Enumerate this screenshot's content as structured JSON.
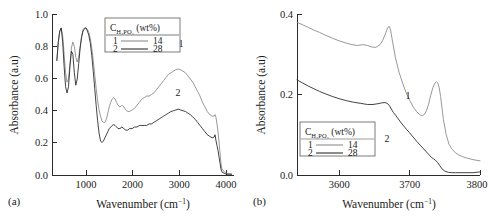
{
  "figure": {
    "panel_a_label": "(a)",
    "panel_b_label": "(b)"
  },
  "panel_a": {
    "xlabel_main": "Wavenumber (cm",
    "xlabel_sup": "−1",
    "xlabel_close": ")",
    "ylabel": "Absorbance (a.u)",
    "xticks": [
      "1000",
      "2000",
      "3000",
      "4000"
    ],
    "yticks": [
      "0.0",
      "0.2",
      "0.4",
      "0.6",
      "0.8",
      "1.0"
    ],
    "legend": {
      "title_c": "C",
      "title_sub": "H₃PO₄",
      "title_unit": " (wt%)",
      "row1_key": "1",
      "row1_value": "14",
      "row2_key": "2",
      "row2_value": "28"
    },
    "annotations": {
      "curve1": "1",
      "curve2": "2"
    }
  },
  "panel_b": {
    "xlabel_main": "Wavenumber (cm",
    "xlabel_sup": "−1",
    "xlabel_close": ")",
    "ylabel": "Absorbance (a.u)",
    "xticks": [
      "3600",
      "3700",
      "3800"
    ],
    "yticks": [
      "0.0",
      "0.2",
      "0.4"
    ],
    "legend": {
      "title_c": "C",
      "title_sub": "H₃PO₄",
      "title_unit": " (wt%)",
      "row1_key": "1",
      "row1_value": "14",
      "row2_key": "2",
      "row2_value": "28"
    },
    "annotations": {
      "curve1": "1",
      "curve2": "2"
    }
  },
  "chart_data": [
    {
      "type": "line",
      "panel": "a",
      "title": "",
      "xlabel": "Wavenumber (cm-1)",
      "ylabel": "Absorbance (a.u)",
      "xlim": [
        300,
        4050
      ],
      "ylim": [
        0.0,
        1.04
      ],
      "xticks": [
        1000,
        2000,
        3000,
        4000
      ],
      "yticks": [
        0.0,
        0.2,
        0.4,
        0.6,
        0.8,
        1.0
      ],
      "grid": false,
      "legend_position": "upper-center",
      "series": [
        {
          "name": "14",
          "label": "1",
          "color": "#8c8c8c",
          "x": [
            400,
            430,
            460,
            490,
            520,
            550,
            580,
            610,
            640,
            670,
            700,
            730,
            760,
            790,
            820,
            850,
            880,
            910,
            940,
            970,
            1000,
            1030,
            1060,
            1090,
            1120,
            1150,
            1180,
            1210,
            1240,
            1270,
            1300,
            1330,
            1360,
            1390,
            1420,
            1450,
            1480,
            1510,
            1540,
            1570,
            1600,
            1630,
            1660,
            1700,
            1740,
            1780,
            1820,
            1860,
            1900,
            1950,
            2000,
            2050,
            2100,
            2150,
            2200,
            2250,
            2300,
            2350,
            2400,
            2450,
            2500,
            2550,
            2600,
            2650,
            2700,
            2750,
            2800,
            2850,
            2900,
            2950,
            3000,
            3050,
            3100,
            3150,
            3200,
            3250,
            3300,
            3350,
            3400,
            3450,
            3500,
            3550,
            3600,
            3640,
            3660,
            3680,
            3700,
            3720,
            3740,
            3760,
            3780,
            3800,
            3850,
            3900,
            4000
          ],
          "y": [
            0.74,
            0.86,
            0.93,
            0.95,
            0.9,
            0.78,
            0.66,
            0.6,
            0.62,
            0.72,
            0.82,
            0.86,
            0.83,
            0.76,
            0.73,
            0.76,
            0.83,
            0.9,
            0.94,
            0.95,
            0.95,
            0.94,
            0.92,
            0.88,
            0.82,
            0.74,
            0.65,
            0.56,
            0.48,
            0.42,
            0.38,
            0.35,
            0.34,
            0.34,
            0.36,
            0.4,
            0.44,
            0.47,
            0.49,
            0.5,
            0.49,
            0.47,
            0.45,
            0.44,
            0.45,
            0.44,
            0.42,
            0.41,
            0.41,
            0.42,
            0.43,
            0.45,
            0.47,
            0.49,
            0.5,
            0.51,
            0.51,
            0.52,
            0.53,
            0.55,
            0.57,
            0.59,
            0.61,
            0.63,
            0.65,
            0.66,
            0.67,
            0.68,
            0.685,
            0.68,
            0.67,
            0.66,
            0.64,
            0.62,
            0.6,
            0.57,
            0.54,
            0.51,
            0.47,
            0.44,
            0.41,
            0.39,
            0.38,
            0.38,
            0.39,
            0.37,
            0.33,
            0.28,
            0.22,
            0.15,
            0.08,
            0.04,
            0.02,
            0.01,
            0.005,
            0.005
          ]
        },
        {
          "name": "28",
          "label": "2",
          "color": "#2e2e2e",
          "x": [
            400,
            430,
            460,
            490,
            520,
            550,
            580,
            610,
            640,
            670,
            700,
            730,
            760,
            790,
            820,
            850,
            880,
            910,
            940,
            970,
            1000,
            1030,
            1060,
            1090,
            1120,
            1150,
            1180,
            1210,
            1240,
            1270,
            1300,
            1330,
            1360,
            1390,
            1420,
            1450,
            1480,
            1510,
            1540,
            1570,
            1600,
            1630,
            1660,
            1700,
            1740,
            1780,
            1820,
            1860,
            1900,
            1950,
            2000,
            2050,
            2100,
            2150,
            2200,
            2250,
            2300,
            2350,
            2400,
            2450,
            2500,
            2550,
            2600,
            2650,
            2700,
            2750,
            2800,
            2850,
            2900,
            2950,
            3000,
            3050,
            3100,
            3150,
            3200,
            3250,
            3300,
            3350,
            3400,
            3450,
            3500,
            3550,
            3600,
            3640,
            3660,
            3680,
            3700,
            3720,
            3740,
            3760,
            3780,
            3800,
            3850,
            3900,
            4000
          ],
          "y": [
            0.74,
            0.86,
            0.93,
            0.95,
            0.86,
            0.7,
            0.57,
            0.53,
            0.57,
            0.7,
            0.8,
            0.78,
            0.66,
            0.58,
            0.62,
            0.72,
            0.82,
            0.89,
            0.93,
            0.945,
            0.95,
            0.93,
            0.9,
            0.85,
            0.77,
            0.67,
            0.56,
            0.45,
            0.35,
            0.27,
            0.22,
            0.21,
            0.22,
            0.24,
            0.26,
            0.28,
            0.3,
            0.31,
            0.32,
            0.325,
            0.32,
            0.31,
            0.3,
            0.3,
            0.31,
            0.3,
            0.29,
            0.29,
            0.3,
            0.3,
            0.31,
            0.31,
            0.32,
            0.32,
            0.32,
            0.32,
            0.33,
            0.33,
            0.34,
            0.35,
            0.36,
            0.37,
            0.38,
            0.39,
            0.4,
            0.41,
            0.415,
            0.42,
            0.425,
            0.42,
            0.415,
            0.41,
            0.4,
            0.39,
            0.375,
            0.36,
            0.34,
            0.32,
            0.3,
            0.28,
            0.26,
            0.25,
            0.24,
            0.245,
            0.26,
            0.22,
            0.19,
            0.16,
            0.12,
            0.08,
            0.04,
            0.02,
            0.01,
            0.005,
            0.005,
            0.005
          ]
        }
      ]
    },
    {
      "type": "line",
      "panel": "b",
      "title": "",
      "xlabel": "Wavenumber (cm-1)",
      "ylabel": "Absorbance (a.u)",
      "xlim": [
        3540,
        3800
      ],
      "ylim": [
        0.0,
        0.42
      ],
      "xticks": [
        3600,
        3700,
        3800
      ],
      "yticks": [
        0.0,
        0.2,
        0.4
      ],
      "grid": false,
      "legend_position": "lower-left",
      "series": [
        {
          "name": "14",
          "label": "1",
          "color": "#8c8c8c",
          "x": [
            3540,
            3548,
            3556,
            3564,
            3572,
            3580,
            3590,
            3600,
            3610,
            3618,
            3626,
            3634,
            3640,
            3646,
            3652,
            3658,
            3662,
            3666,
            3669,
            3671,
            3673,
            3676,
            3680,
            3685,
            3690,
            3695,
            3700,
            3705,
            3710,
            3715,
            3718,
            3721,
            3724,
            3727,
            3730,
            3733,
            3736,
            3738,
            3740,
            3742,
            3744,
            3746,
            3748,
            3752,
            3756,
            3760,
            3765,
            3770,
            3775,
            3780,
            3790,
            3800
          ],
          "y": [
            0.398,
            0.392,
            0.385,
            0.378,
            0.372,
            0.365,
            0.357,
            0.35,
            0.344,
            0.34,
            0.338,
            0.34,
            0.338,
            0.334,
            0.333,
            0.34,
            0.352,
            0.37,
            0.385,
            0.388,
            0.378,
            0.345,
            0.305,
            0.268,
            0.24,
            0.215,
            0.195,
            0.178,
            0.165,
            0.157,
            0.155,
            0.158,
            0.168,
            0.185,
            0.208,
            0.228,
            0.24,
            0.243,
            0.24,
            0.228,
            0.205,
            0.175,
            0.145,
            0.105,
            0.08,
            0.068,
            0.058,
            0.052,
            0.048,
            0.045,
            0.04,
            0.037
          ]
        },
        {
          "name": "28",
          "label": "2",
          "color": "#2e2e2e",
          "x": [
            3540,
            3548,
            3556,
            3564,
            3572,
            3580,
            3590,
            3600,
            3610,
            3620,
            3630,
            3640,
            3648,
            3655,
            3660,
            3665,
            3668,
            3671,
            3674,
            3677,
            3680,
            3684,
            3688,
            3692,
            3696,
            3700,
            3705,
            3710,
            3715,
            3720,
            3724,
            3728,
            3731,
            3734,
            3737,
            3740,
            3743,
            3746,
            3750,
            3755,
            3760,
            3765,
            3770,
            3780,
            3790,
            3800
          ],
          "y": [
            0.248,
            0.24,
            0.232,
            0.225,
            0.218,
            0.212,
            0.205,
            0.199,
            0.194,
            0.19,
            0.187,
            0.184,
            0.184,
            0.186,
            0.188,
            0.189,
            0.187,
            0.182,
            0.172,
            0.163,
            0.156,
            0.146,
            0.136,
            0.127,
            0.118,
            0.11,
            0.099,
            0.088,
            0.078,
            0.068,
            0.06,
            0.052,
            0.046,
            0.042,
            0.038,
            0.032,
            0.024,
            0.016,
            0.01,
            0.007,
            0.006,
            0.006,
            0.006,
            0.006,
            0.006,
            0.008
          ]
        }
      ]
    }
  ]
}
